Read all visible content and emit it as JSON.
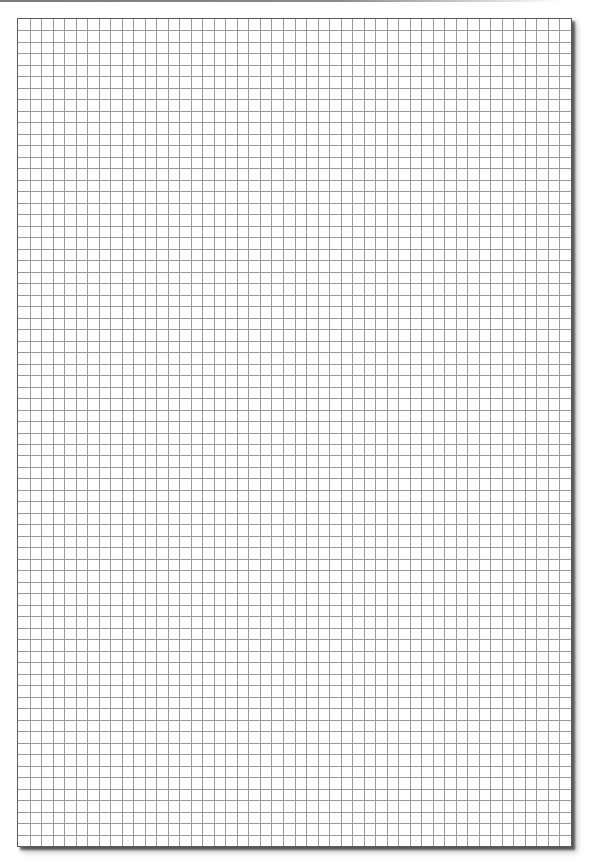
{
  "document": {
    "type": "graph-paper",
    "page": {
      "background_color": "#ffffff",
      "border_color": "#5a5a5a",
      "shadow": true
    },
    "grid": {
      "columns": 48,
      "rows": 72,
      "cell_size_px": 11.56,
      "line_color": "#9a9a9a",
      "major_lines": false
    },
    "top_strip_color": "#7a7a7a"
  }
}
